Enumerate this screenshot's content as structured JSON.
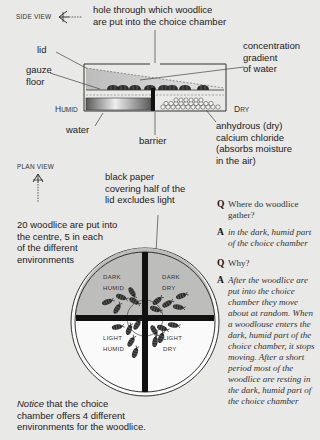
{
  "side_view": {
    "title": "SIDE VIEW",
    "hole_label": [
      "hole through which woodlice",
      "are put into the choice chamber"
    ],
    "lid_label": "lid",
    "gauze_label": [
      "gauze",
      "floor"
    ],
    "humid_label": {
      "first": "H",
      "rest": "UMID"
    },
    "dry_label": {
      "first": "D",
      "rest": "RY"
    },
    "water_label": "water",
    "barrier_label": "barrier",
    "gradient_label": [
      "concentration",
      "gradient",
      "of water"
    ],
    "chloride_label": [
      "anhydrous (dry)",
      "calcium chloride",
      "(absorbs moisture",
      "in the air)"
    ]
  },
  "plan_view": {
    "title": "PLAN VIEW",
    "black_paper_label": [
      "black paper",
      "covering half of the",
      "lid excludes light"
    ],
    "woodlice_label": [
      "20 woodlice are put into",
      "the centre, 5 in each",
      "of the different",
      "environments"
    ],
    "quadrants": {
      "dark_humid": [
        "DARK",
        "HUMID"
      ],
      "dark_dry": [
        "DARK",
        "DRY"
      ],
      "light_humid": [
        "LIGHT",
        "HUMID"
      ],
      "light_dry": [
        "LIGHT",
        "DRY"
      ]
    },
    "notice": {
      "emph": "Notice",
      "rest": " that the choice",
      "line2": "chamber offers 4 different",
      "line3": "environments for the woodlice."
    }
  },
  "qa": [
    {
      "key": "Q",
      "text": "Where do woodlice gather?",
      "italic": false
    },
    {
      "key": "A",
      "text": "in the dark, humid part of the choice chamber",
      "italic": true
    },
    {
      "key": "Q",
      "text": "Why?",
      "italic": false
    },
    {
      "key": "A",
      "text": "After the woodlice are put into the choice chamber they move about at random. When a woodlouse enters the dark, humid part of the choice chamber, it stops moving. After a short period most of the woodlice are resting in the dark, humid part of the choice chamber",
      "italic": true
    }
  ],
  "colors": {
    "background": "#e9e9e7",
    "dark_quadrant": "#bdbdbb",
    "ink": "#1e1e1e"
  }
}
